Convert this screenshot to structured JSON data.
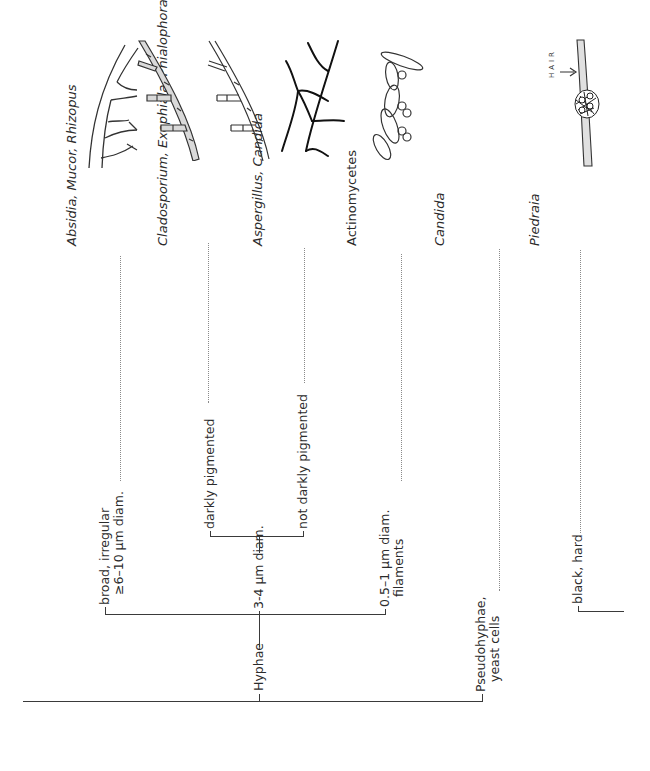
{
  "diagram": {
    "type": "dichotomous-key",
    "orientation": "rotated-90-ccw",
    "root": {
      "branches": {
        "hyphae": {
          "label": "Hyphae",
          "sub": {
            "broad": {
              "line1": "broad, irregular",
              "line2": "≥6–10 μm diam.",
              "result": "Absidia, Mucor, Rhizopus"
            },
            "medium": {
              "label": "3-4 μm diam.",
              "sub": {
                "dark": {
                  "label": "darkly pigmented",
                  "result": "Cladosporium, Exophiala, Phialophora"
                },
                "notdark": {
                  "label": "not darkly pigmented",
                  "result": "Aspergillus, Candida"
                }
              }
            },
            "thin": {
              "line1": "0.5–1 μm diam.",
              "line2": "filaments",
              "result": "Actinomycetes"
            }
          }
        },
        "pseudo": {
          "line1": "Pseudohyphae,",
          "line2": "yeast cells",
          "result": "Candida"
        }
      }
    },
    "second_root": {
      "black": {
        "label": "black, hard",
        "result": "Piedraia"
      }
    },
    "illustrations": [
      {
        "name": "broad-aseptate-hyphae",
        "for": "Absidia, Mucor, Rhizopus"
      },
      {
        "name": "pigmented-septate-hyphae",
        "for": "Cladosporium, Exophiala, Phialophora"
      },
      {
        "name": "hyaline-septate-hyphae",
        "for": "Aspergillus, Candida"
      },
      {
        "name": "thin-branching-filaments",
        "for": "Actinomycetes"
      },
      {
        "name": "pseudohyphae-yeast",
        "for": "Candida"
      },
      {
        "name": "hair-nodule",
        "for": "Piedraia",
        "hair_label": "HAIR"
      }
    ],
    "colors": {
      "line": "#3a3a3a",
      "pigment_fill": "#d9d9d9",
      "hair_fill": "#e0e0e0"
    }
  }
}
